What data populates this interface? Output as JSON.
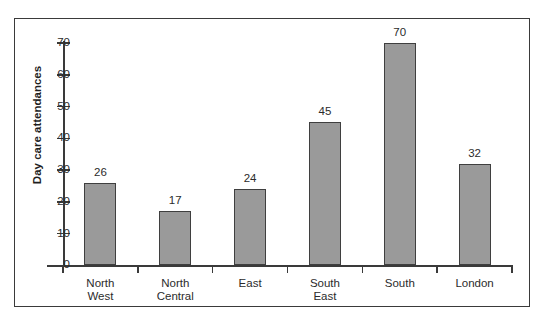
{
  "chart_data": {
    "type": "bar",
    "title": "",
    "subtitle": "",
    "xlabel": "",
    "ylabel": "Day care attendances",
    "categories": [
      "North West",
      "North Central",
      "East",
      "South East",
      "South",
      "London"
    ],
    "category_lines": [
      [
        "North",
        "West"
      ],
      [
        "North",
        "Central"
      ],
      [
        "East"
      ],
      [
        "South",
        "East"
      ],
      [
        "South"
      ],
      [
        "London"
      ]
    ],
    "values": [
      26,
      17,
      24,
      45,
      70,
      32
    ],
    "value_labels": [
      "26",
      "17",
      "24",
      "45",
      "70",
      "32"
    ],
    "ylim": [
      0,
      70
    ],
    "yticks": [
      0,
      10,
      20,
      30,
      40,
      50,
      60,
      70
    ],
    "ytick_labels": [
      "0",
      "10",
      "20",
      "30",
      "40",
      "50",
      "60",
      "70"
    ],
    "grid": false,
    "legend": false,
    "legend_position": "none",
    "bar_color": "#9a9a9a",
    "bar_border_color": "#3f3f3f",
    "axis_color": "#3a3a3a",
    "text_color": "#2b2b2b",
    "frame_color": "#3a3a3a",
    "background_color": "#ffffff"
  }
}
